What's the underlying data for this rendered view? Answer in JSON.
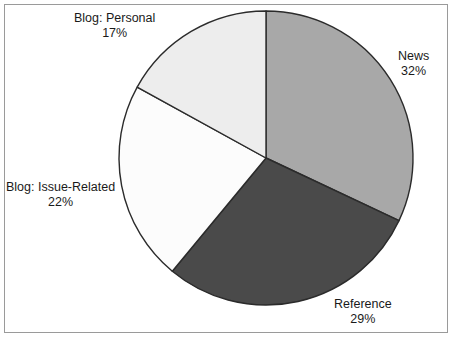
{
  "chart_data": {
    "type": "pie",
    "title": "",
    "subtitle": "",
    "xlabel": "",
    "ylabel": "",
    "legend_position": "none",
    "grid": false,
    "start_angle_deg": 0,
    "direction": "clockwise",
    "units": "percent",
    "categories": [
      "News",
      "Reference",
      "Blog: Issue-Related",
      "Blog: Personal"
    ],
    "values": [
      32,
      29,
      22,
      17
    ],
    "slices": [
      {
        "label": "News",
        "value": 32,
        "value_text": "32%",
        "color": "#a8a8a8"
      },
      {
        "label": "Reference",
        "value": 29,
        "value_text": "29%",
        "color": "#4a4a4a"
      },
      {
        "label": "Blog: Issue-Related",
        "value": 22,
        "value_text": "22%",
        "color": "#fcfcfc"
      },
      {
        "label": "Blog: Personal",
        "value": 17,
        "value_text": "17%",
        "color": "#ededed"
      }
    ],
    "total": 100,
    "stroke_color": "#2b2b2b",
    "background_color": "#ffffff",
    "frame_color": "#9a9a9a"
  }
}
